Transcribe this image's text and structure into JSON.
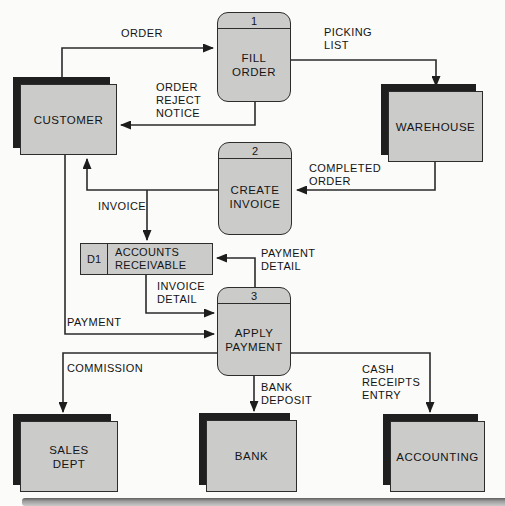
{
  "diagram_type": "data-flow-diagram",
  "colors": {
    "box_fill": "#cbcbca",
    "box_border": "#2d2d2d",
    "shadow": "#1f1f1f",
    "flow_line": "#2b2b2b",
    "background": "#fbfbf9",
    "bottom_bar": "#9d9d9d"
  },
  "processes": [
    {
      "number": "1",
      "name": "FILL\nORDER"
    },
    {
      "number": "2",
      "name": "CREATE\nINVOICE"
    },
    {
      "number": "3",
      "name": "APPLY\nPAYMENT"
    }
  ],
  "external_entities": [
    {
      "name": "CUSTOMER"
    },
    {
      "name": "WAREHOUSE"
    },
    {
      "name": "SALES\nDEPT"
    },
    {
      "name": "BANK"
    },
    {
      "name": "ACCOUNTING"
    }
  ],
  "data_stores": [
    {
      "id": "D1",
      "name": "ACCOUNTS\nRECEIVABLE"
    }
  ],
  "flows": [
    {
      "label": "ORDER",
      "from": "CUSTOMER",
      "to": "FILL ORDER"
    },
    {
      "label": "PICKING\nLIST",
      "from": "FILL ORDER",
      "to": "WAREHOUSE"
    },
    {
      "label": "ORDER\nREJECT\nNOTICE",
      "from": "FILL ORDER",
      "to": "CUSTOMER"
    },
    {
      "label": "COMPLETED\nORDER",
      "from": "WAREHOUSE",
      "to": "CREATE INVOICE"
    },
    {
      "label": "INVOICE",
      "from": "CREATE INVOICE",
      "to": "CUSTOMER / ACCOUNTS RECEIVABLE"
    },
    {
      "label": "PAYMENT\nDETAIL",
      "from": "APPLY PAYMENT",
      "to": "ACCOUNTS RECEIVABLE"
    },
    {
      "label": "INVOICE\nDETAIL",
      "from": "ACCOUNTS RECEIVABLE",
      "to": "APPLY PAYMENT"
    },
    {
      "label": "PAYMENT",
      "from": "CUSTOMER",
      "to": "APPLY PAYMENT"
    },
    {
      "label": "COMMISSION",
      "from": "APPLY PAYMENT",
      "to": "SALES DEPT"
    },
    {
      "label": "BANK\nDEPOSIT",
      "from": "APPLY PAYMENT",
      "to": "BANK"
    },
    {
      "label": "CASH\nRECEIPTS\nENTRY",
      "from": "APPLY PAYMENT",
      "to": "ACCOUNTING"
    }
  ]
}
